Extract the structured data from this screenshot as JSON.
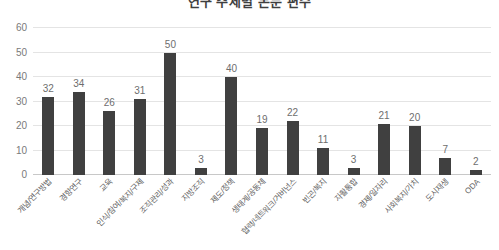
{
  "chart_data": {
    "type": "bar",
    "title": "연구 주제별 논문 편수",
    "xlabel": "",
    "ylabel": "",
    "ylim": [
      0,
      60
    ],
    "yticks": [
      0,
      10,
      20,
      30,
      40,
      50,
      60
    ],
    "grid": true,
    "legend": false,
    "bar_color": "#404040",
    "categories": [
      "개념/연구방법",
      "경향연구",
      "교육",
      "인식/참여/복지/구제",
      "조직관리/성과",
      "지방조직",
      "제도/정책",
      "생태계/공동체",
      "협력/네트워크/거버넌스",
      "빈곤/복지",
      "자활통합",
      "경제/일자리",
      "사회복지/가치",
      "도시재생",
      "ODA"
    ],
    "values": [
      32,
      34,
      26,
      31,
      50,
      3,
      40,
      19,
      22,
      11,
      3,
      21,
      20,
      7,
      2
    ]
  }
}
